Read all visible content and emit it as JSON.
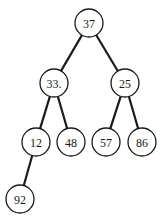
{
  "diagram": {
    "type": "binary-tree",
    "nodes": [
      {
        "id": "n37",
        "label": "37",
        "x": 89,
        "y": 23
      },
      {
        "id": "n33",
        "label": "33.",
        "x": 54,
        "y": 83
      },
      {
        "id": "n25",
        "label": "25",
        "x": 125,
        "y": 83
      },
      {
        "id": "n12",
        "label": "12",
        "x": 36,
        "y": 142
      },
      {
        "id": "n48",
        "label": "48",
        "x": 71,
        "y": 142
      },
      {
        "id": "n57",
        "label": "57",
        "x": 106,
        "y": 142
      },
      {
        "id": "n86",
        "label": "86",
        "x": 142,
        "y": 142
      },
      {
        "id": "n92",
        "label": "92",
        "x": 20,
        "y": 199
      }
    ],
    "edges": [
      {
        "from": "n37",
        "to": "n33"
      },
      {
        "from": "n37",
        "to": "n25"
      },
      {
        "from": "n33",
        "to": "n12"
      },
      {
        "from": "n33",
        "to": "n48"
      },
      {
        "from": "n25",
        "to": "n57"
      },
      {
        "from": "n25",
        "to": "n86"
      },
      {
        "from": "n12",
        "to": "n92"
      }
    ],
    "node_radius": 14
  }
}
